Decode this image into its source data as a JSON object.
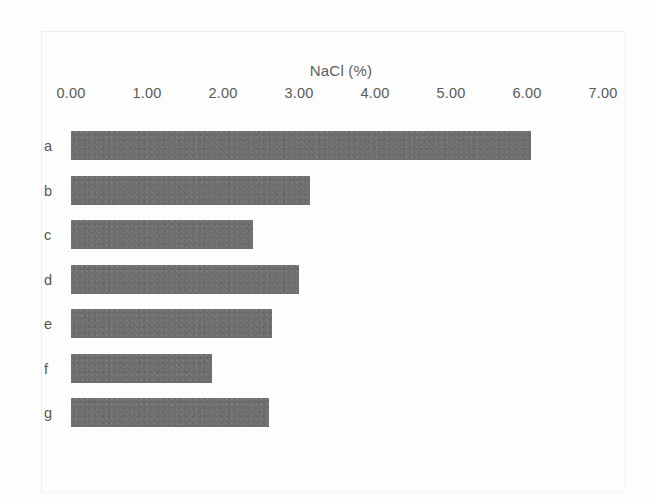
{
  "chart_data": {
    "type": "bar",
    "orientation": "horizontal",
    "title": "",
    "xlabel": "NaCl (%)",
    "ylabel": "",
    "categories": [
      "a",
      "b",
      "c",
      "d",
      "e",
      "f",
      "g"
    ],
    "values": [
      6.05,
      3.15,
      2.4,
      3.0,
      2.65,
      1.85,
      2.6
    ],
    "xlim": [
      0.0,
      7.0
    ],
    "xticks": [
      0.0,
      1.0,
      2.0,
      3.0,
      4.0,
      5.0,
      6.0,
      7.0
    ],
    "xtick_labels": [
      "0.00",
      "1.00",
      "2.00",
      "3.00",
      "4.00",
      "5.00",
      "6.00",
      "7.00"
    ],
    "grid": false,
    "legend": null,
    "bar_color": "#6e6e6e",
    "background_color": "#fdfdfd",
    "axis_text_color": "#5a5a5a"
  },
  "figure": {
    "axis_title": "NaCl (%)"
  }
}
